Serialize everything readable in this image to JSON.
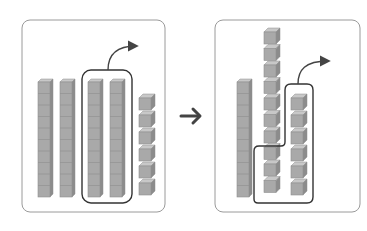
{
  "diagram": {
    "colors": {
      "panel_border": "#9a9a9a",
      "loop_stroke": "#333333",
      "arrow": "#444444",
      "cube_front": "#a9a9a9",
      "cube_top": "#c8c8c8",
      "cube_side": "#8c8c8c",
      "cube_line": "#8f8f8f"
    },
    "left_panel": {
      "label": "Before",
      "tens_rods": 4,
      "unit_cubes": 6,
      "circled_rods": 2,
      "value": 46
    },
    "transition_arrow": "right-arrow",
    "right_panel": {
      "label": "After",
      "tens_rods": 1,
      "broken_rod_cubes": 10,
      "unit_cubes": 6,
      "circled_cubes": 9,
      "value": 26
    }
  }
}
